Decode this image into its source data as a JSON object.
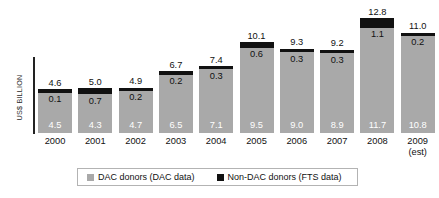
{
  "chart_data": {
    "type": "bar",
    "subtype": "stacked-bar",
    "title": "",
    "xlabel": "",
    "ylabel": "US$ BILLION",
    "ylim": [
      0,
      12.8
    ],
    "grid": false,
    "legend_position": "bottom",
    "categories": [
      "2000",
      "2001",
      "2002",
      "2003",
      "2004",
      "2005",
      "2006",
      "2007",
      "2008",
      "2009"
    ],
    "category_sublabels": [
      "",
      "",
      "",
      "",
      "",
      "",
      "",
      "",
      "",
      "(est)"
    ],
    "series": [
      {
        "name": "DAC donors (DAC data)",
        "color": "#a9a9a9",
        "values": [
          4.5,
          4.3,
          4.7,
          6.5,
          7.1,
          9.5,
          9.0,
          8.9,
          11.7,
          10.8
        ]
      },
      {
        "name": "Non-DAC donors (FTS data)",
        "color": "#111111",
        "values": [
          0.1,
          0.7,
          0.2,
          0.2,
          0.3,
          0.6,
          0.3,
          0.3,
          1.1,
          0.2
        ]
      }
    ],
    "totals": [
      4.6,
      5.0,
      4.9,
      6.7,
      7.4,
      10.1,
      9.3,
      9.2,
      12.8,
      11.0
    ],
    "value_labels": {
      "dac": [
        "4.5",
        "4.3",
        "4.7",
        "6.5",
        "7.1",
        "9.5",
        "9.0",
        "8.9",
        "11.7",
        "10.8"
      ],
      "nondac": [
        "0.1",
        "0.7",
        "0.2",
        "0.2",
        "0.3",
        "0.6",
        "0.3",
        "0.3",
        "1.1",
        "0.2"
      ],
      "total": [
        "4.6",
        "5.0",
        "4.9",
        "6.7",
        "7.4",
        "10.1",
        "9.3",
        "9.2",
        "12.8",
        "11.0"
      ]
    }
  },
  "axis": {
    "y_label": "US$ BILLION"
  },
  "legend": {
    "items": [
      {
        "label": "DAC donors (DAC data)",
        "color": "#a9a9a9"
      },
      {
        "label": "Non-DAC donors (FTS data)",
        "color": "#111111"
      }
    ]
  },
  "colors": {
    "dac": "#a9a9a9",
    "nondac": "#111111",
    "background": "#ffffff",
    "text": "#111111",
    "axis": "#222222",
    "legend_border": "#b3b3b3"
  }
}
